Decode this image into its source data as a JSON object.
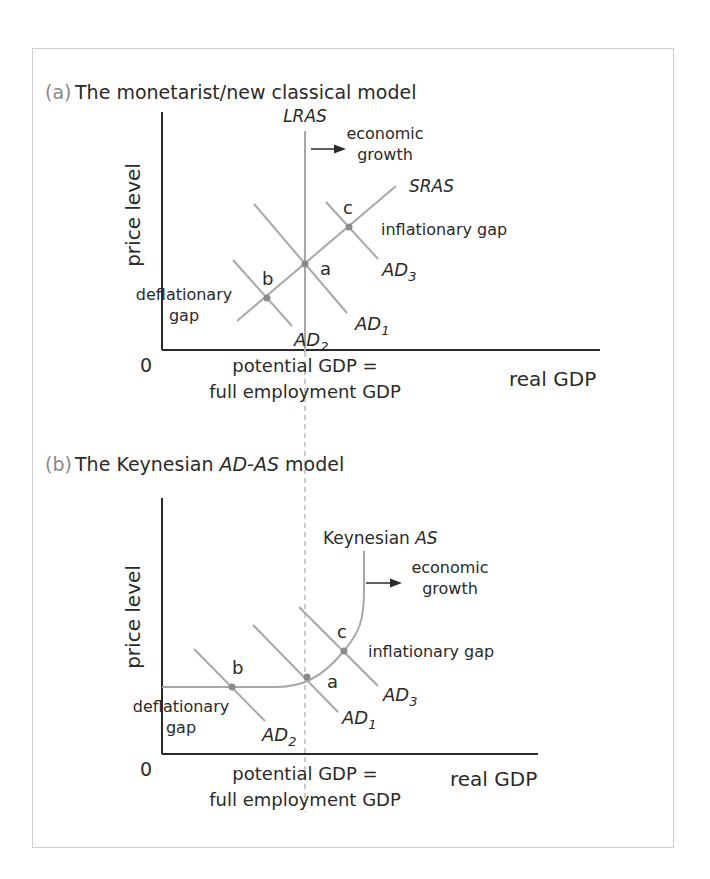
{
  "panel_a": {
    "label": "(a)",
    "title": "The monetarist/new classical model",
    "y_axis": "price level",
    "x_axis": "real GDP",
    "origin": "0",
    "potential_line_1": "potential GDP =",
    "potential_line_2": "full employment GDP",
    "lras": "LRAS",
    "sras": "SRAS",
    "growth_1": "economic",
    "growth_2": "growth",
    "point_a": "a",
    "point_b": "b",
    "point_c": "c",
    "inflationary_gap": "inflationary gap",
    "deflationary_gap_1": "deflationary",
    "deflationary_gap_2": "gap",
    "ad1": "AD",
    "ad1_sub": "1",
    "ad2": "AD",
    "ad2_sub": "2",
    "ad3": "AD",
    "ad3_sub": "3"
  },
  "panel_b": {
    "label": "(b)",
    "title_pre": "The Keynesian ",
    "title_it": "AD-AS",
    "title_post": " model",
    "y_axis": "price level",
    "x_axis": "real GDP",
    "origin": "0",
    "potential_line_1": "potential GDP =",
    "potential_line_2": "full employment GDP",
    "as_pre": "Keynesian ",
    "as_it": "AS",
    "growth_1": "economic",
    "growth_2": "growth",
    "point_a": "a",
    "point_b": "b",
    "point_c": "c",
    "inflationary_gap": "inflationary gap",
    "deflationary_gap_1": "deflationary",
    "deflationary_gap_2": "gap",
    "ad1": "AD",
    "ad1_sub": "1",
    "ad2": "AD",
    "ad2_sub": "2",
    "ad3": "AD",
    "ad3_sub": "3"
  },
  "colors": {
    "curve": "#a8a8a8",
    "axis": "#2a2a2a",
    "point": "#8a8a8a",
    "border": "#cfcfcf"
  }
}
